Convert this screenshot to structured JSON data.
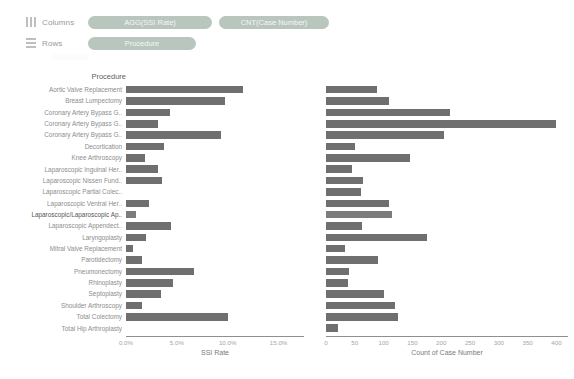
{
  "shelves": {
    "columns": {
      "label": "Columns",
      "icon": "columns-icon",
      "pills": [
        {
          "label": "AGG(SSI Rate)"
        },
        {
          "label": "CNT(Case Number)"
        }
      ]
    },
    "rows": {
      "label": "Rows",
      "icon": "rows-icon",
      "pills": [
        {
          "label": "Procedure"
        }
      ]
    }
  },
  "viz": {
    "row_header": "Procedure",
    "bar_color": "#6f6f6f",
    "pill_color": "#b9c6be"
  },
  "chart_data": [
    {
      "type": "bar",
      "orientation": "horizontal",
      "title": "",
      "xlabel": "SSI Rate",
      "ylabel": "Procedure",
      "xlim": [
        0,
        17.5
      ],
      "xticks": [
        0,
        5,
        10,
        15
      ],
      "xticklabels": [
        "0.0%",
        "5.0%",
        "10.0%",
        "15.0%"
      ],
      "grid": false,
      "categories": [
        "Aortic Valve Replacement",
        "Breast Lumpectomy",
        "Coronary Artery Bypass G..",
        "Coronary Artery Bypass G..",
        "Coronary Artery Bypass G..",
        "Decortication",
        "Knee Arthroscopy",
        "Laparoscopic Inguinal Her..",
        "Laparoscopic Nissen Fund..",
        "Laparoscopic Partial Colec..",
        "Laparoscopic Ventral Her..",
        "Laparoscopic/Laparoscopic Ap..",
        "Laparoscopic Appendect..",
        "Laryngoplasty",
        "Mitral Valve Replacement",
        "Parotidectomy",
        "Pneumonectomy",
        "Rhinoplasty",
        "Septoplasty",
        "Shoulder Arthroscopy",
        "Total Colectomy",
        "Total Hip Arthroplasty"
      ],
      "values": [
        11.5,
        9.7,
        4.3,
        3.1,
        9.3,
        3.7,
        1.9,
        3.1,
        3.5,
        0.0,
        2.3,
        1.0,
        4.4,
        2.0,
        0.7,
        1.6,
        6.7,
        4.6,
        3.4,
        1.6,
        10.0,
        0.0
      ]
    },
    {
      "type": "bar",
      "orientation": "horizontal",
      "title": "",
      "xlabel": "Count of Case Number",
      "ylabel": "Procedure",
      "xlim": [
        0,
        420
      ],
      "xticks": [
        0,
        50,
        100,
        150,
        200,
        250,
        300,
        350,
        400
      ],
      "xticklabels": [
        "0",
        "50",
        "100",
        "150",
        "200",
        "250",
        "300",
        "350",
        "400"
      ],
      "grid": false,
      "categories": [
        "Aortic Valve Replacement",
        "Breast Lumpectomy",
        "Coronary Artery Bypass G..",
        "Coronary Artery Bypass G..",
        "Coronary Artery Bypass G..",
        "Decortication",
        "Knee Arthroscopy",
        "Laparoscopic Inguinal Her..",
        "Laparoscopic Nissen Fund..",
        "Laparoscopic Partial Colec..",
        "Laparoscopic Ventral Her..",
        "Laparoscopic/Laparoscopic Ap..",
        "Laparoscopic Appendect..",
        "Laryngoplasty",
        "Mitral Valve Replacement",
        "Parotidectomy",
        "Pneumonectomy",
        "Rhinoplasty",
        "Septoplasty",
        "Shoulder Arthroscopy",
        "Total Colectomy",
        "Total Hip Arthroplasty"
      ],
      "values": [
        88,
        110,
        215,
        400,
        205,
        50,
        145,
        45,
        65,
        60,
        110,
        115,
        63,
        175,
        33,
        90,
        40,
        38,
        100,
        120,
        125,
        20
      ]
    }
  ]
}
